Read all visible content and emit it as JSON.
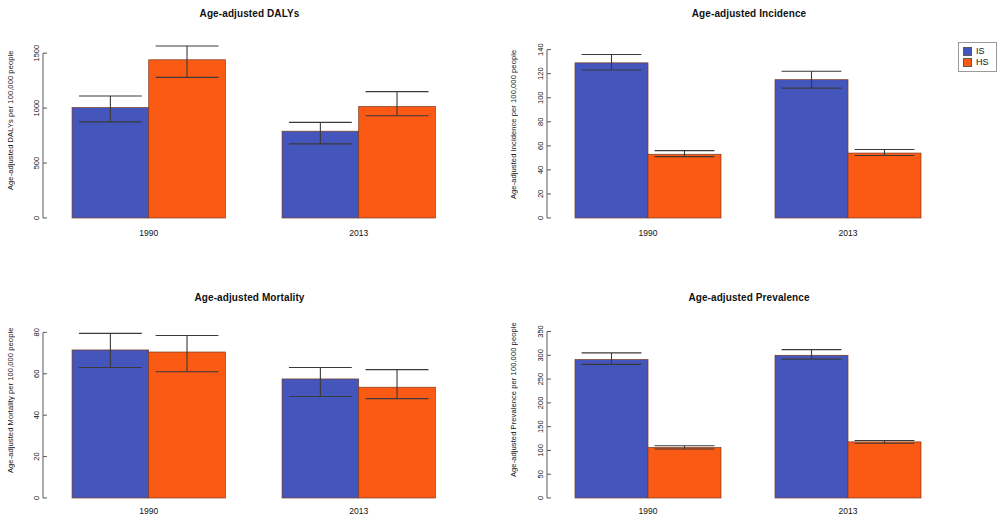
{
  "figure": {
    "legend": {
      "position": "top-right",
      "entries": [
        {
          "label": "IS",
          "color": "#4456bc"
        },
        {
          "label": "HS",
          "color": "#fa5a14"
        }
      ]
    },
    "colors": {
      "IS": "#4456bc",
      "HS": "#fa5a14",
      "error_bar": "#3a3a3a",
      "axis": "#585858"
    }
  },
  "chart_data": [
    {
      "type": "bar",
      "panel": "top-left",
      "title": "Age-adjusted DALYs",
      "xlabel": "",
      "ylabel": "Age-adjusted DALYs per 100,000 people",
      "categories": [
        "1990",
        "2013"
      ],
      "yticks": [
        0,
        500,
        1000,
        1500
      ],
      "ylim": [
        0,
        1620
      ],
      "grid": false,
      "series": [
        {
          "name": "IS",
          "color": "#4456bc",
          "values": [
            1005,
            790
          ],
          "ci_low": [
            875,
            675
          ],
          "ci_high": [
            1110,
            870
          ]
        },
        {
          "name": "HS",
          "color": "#fa5a14",
          "values": [
            1440,
            1015
          ],
          "ci_low": [
            1280,
            930
          ],
          "ci_high": [
            1565,
            1150
          ]
        }
      ]
    },
    {
      "type": "bar",
      "panel": "top-right",
      "title": "Age-adjusted Incidence",
      "xlabel": "",
      "ylabel": "Age-adjusted Incidence per 100,000 people",
      "categories": [
        "1990",
        "2013"
      ],
      "yticks": [
        0,
        20,
        40,
        60,
        80,
        100,
        120,
        140
      ],
      "ylim": [
        0,
        148
      ],
      "grid": false,
      "series": [
        {
          "name": "IS",
          "color": "#4456bc",
          "values": [
            129,
            115
          ],
          "ci_low": [
            123,
            108
          ],
          "ci_high": [
            136,
            122
          ]
        },
        {
          "name": "HS",
          "color": "#fa5a14",
          "values": [
            53,
            54
          ],
          "ci_low": [
            51,
            52
          ],
          "ci_high": [
            56,
            57
          ]
        }
      ]
    },
    {
      "type": "bar",
      "panel": "bottom-left",
      "title": "Age-adjusted Mortality",
      "xlabel": "",
      "ylabel": "Age-adjusted Mortality per 100,000 people",
      "categories": [
        "1990",
        "2013"
      ],
      "yticks": [
        0,
        20,
        40,
        60,
        80
      ],
      "ylim": [
        0,
        85
      ],
      "grid": false,
      "series": [
        {
          "name": "IS",
          "color": "#4456bc",
          "values": [
            71.5,
            57.5
          ],
          "ci_low": [
            63,
            49
          ],
          "ci_high": [
            79.5,
            63
          ]
        },
        {
          "name": "HS",
          "color": "#fa5a14",
          "values": [
            70.5,
            53.5
          ],
          "ci_low": [
            61,
            48
          ],
          "ci_high": [
            78.5,
            62
          ]
        }
      ]
    },
    {
      "type": "bar",
      "panel": "bottom-right",
      "title": "Age-adjusted Prevalence",
      "xlabel": "",
      "ylabel": "Age-adjusted Prevalence per 100,000 people",
      "categories": [
        "1990",
        "2013"
      ],
      "yticks": [
        0,
        50,
        100,
        150,
        200,
        250,
        300,
        350
      ],
      "ylim": [
        0,
        370
      ],
      "grid": false,
      "series": [
        {
          "name": "IS",
          "color": "#4456bc",
          "values": [
            291,
            300
          ],
          "ci_low": [
            281,
            292
          ],
          "ci_high": [
            305,
            312
          ]
        },
        {
          "name": "HS",
          "color": "#fa5a14",
          "values": [
            106,
            118
          ],
          "ci_low": [
            103,
            115
          ],
          "ci_high": [
            110,
            121
          ]
        }
      ]
    }
  ]
}
